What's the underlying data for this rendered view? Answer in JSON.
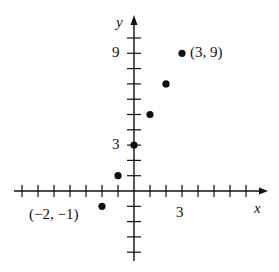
{
  "chart_data": {
    "type": "scatter",
    "title": "",
    "xlabel": "x",
    "ylabel": "y",
    "x_ticks_labeled": [
      3
    ],
    "y_ticks_labeled": [
      3,
      9
    ],
    "xlim": [
      -7,
      7
    ],
    "ylim": [
      -4,
      10
    ],
    "grid": false,
    "points": [
      {
        "x": -2,
        "y": -1
      },
      {
        "x": -1,
        "y": 1
      },
      {
        "x": 0,
        "y": 3
      },
      {
        "x": 1,
        "y": 5
      },
      {
        "x": 2,
        "y": 7
      },
      {
        "x": 3,
        "y": 9
      }
    ],
    "annotations": [
      {
        "text": "(−2, −1)",
        "x": -2,
        "y": -1
      },
      {
        "text": "(3, 9)",
        "x": 3,
        "y": 9
      }
    ]
  },
  "labels": {
    "x_axis": "x",
    "y_axis": "y",
    "x_tick_3": "3",
    "y_tick_3": "3",
    "y_tick_9": "9",
    "point_low": "(−2, −1)",
    "point_high": "(3, 9)"
  }
}
